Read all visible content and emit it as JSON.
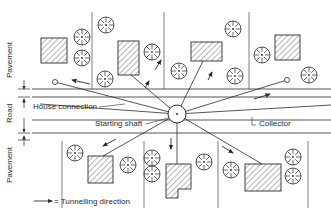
{
  "labels": {
    "pavement_top": "Pavement",
    "road": "Road",
    "pavement_bottom": "Pavement",
    "house_connection": "House connection",
    "starting_shaft": "Starting shaft",
    "collector": "Collector",
    "legend": "= Tunnelling direction"
  },
  "colors": {
    "line": "#2a2a2a",
    "background": "#ffffff"
  },
  "icons": {
    "tree": "tree-icon",
    "house": "house-icon",
    "arrow": "arrow-icon",
    "shaft": "shaft-circle-icon"
  }
}
